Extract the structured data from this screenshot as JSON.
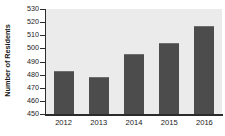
{
  "chart_data": {
    "type": "bar",
    "title": "",
    "xlabel": "",
    "ylabel": "Number of Residents",
    "categories": [
      "2012",
      "2013",
      "2014",
      "2015",
      "2016"
    ],
    "values": [
      483,
      478,
      496,
      504,
      517
    ],
    "ylim": [
      450,
      530
    ],
    "ytick_step": 10,
    "yticks": [
      450,
      460,
      470,
      480,
      490,
      500,
      510,
      520,
      530
    ],
    "ytick_labels": [
      "450",
      "460",
      "470",
      "480",
      "490",
      "500",
      "510",
      "520",
      "530"
    ],
    "grid": false,
    "legend": false,
    "legend_position": "none",
    "colors": {
      "bar": "#4c4c4c",
      "bar_highlight": "#6e6e6e",
      "plot_background": "#ebebeb",
      "page_background": "#ffffff",
      "axis": "#2b2b2b",
      "text": "#1a1a1a"
    }
  }
}
